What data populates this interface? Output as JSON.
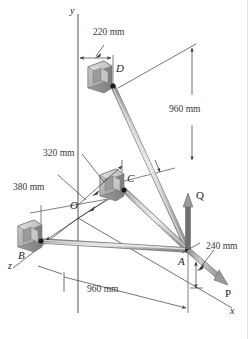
{
  "figure": {
    "type": "engineering-statics-diagram",
    "background_color": "#ffffff",
    "axes": [
      {
        "name": "y-axis",
        "label": "y"
      },
      {
        "name": "x-axis",
        "label": "x"
      },
      {
        "name": "z-axis",
        "label": "z"
      }
    ],
    "points": [
      {
        "name": "origin",
        "label": "O"
      },
      {
        "name": "point-a",
        "label": "A"
      },
      {
        "name": "point-b",
        "label": "B"
      },
      {
        "name": "point-c",
        "label": "C"
      },
      {
        "name": "point-d",
        "label": "D"
      }
    ],
    "dimensions": [
      {
        "name": "dim-220",
        "label": "220 mm"
      },
      {
        "name": "dim-960-vertical",
        "label": "960 mm"
      },
      {
        "name": "dim-320",
        "label": "320 mm"
      },
      {
        "name": "dim-380",
        "label": "380 mm"
      },
      {
        "name": "dim-240",
        "label": "240 mm"
      },
      {
        "name": "dim-960-horizontal",
        "label": "960 mm"
      }
    ],
    "forces": [
      {
        "name": "force-q",
        "label": "Q",
        "direction": "vertical-up"
      },
      {
        "name": "force-p",
        "label": "P",
        "direction": "along-x-down-right"
      }
    ],
    "colors": {
      "cable": "#b3b3b3",
      "cable_edge": "#8a8a8a",
      "bracket_face": "#bdbdbd",
      "bracket_side": "#989898",
      "bracket_top": "#d6d6d6",
      "line": "#4a4a4a",
      "arrow": "#3a3a3a",
      "force_arrow": "#8c8c8c"
    }
  }
}
